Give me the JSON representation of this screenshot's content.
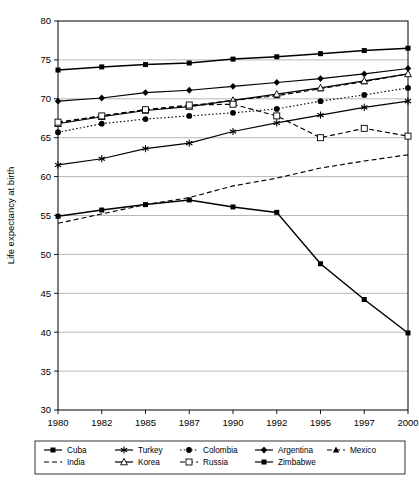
{
  "chart_data": {
    "type": "line",
    "title": "",
    "xlabel": "",
    "ylabel": "Life expectancy at birth",
    "ylim": [
      30,
      80
    ],
    "yticks": [
      30,
      35,
      40,
      45,
      50,
      55,
      60,
      65,
      70,
      75,
      80
    ],
    "grid": true,
    "legend_position": "bottom",
    "categories": [
      "1980",
      "1982",
      "1985",
      "1987",
      "1990",
      "1992",
      "1995",
      "1997",
      "2000"
    ],
    "series": [
      {
        "name": "Cuba",
        "marker": "filled-square",
        "line": "solid",
        "values": [
          73.7,
          74.1,
          74.4,
          74.6,
          75.1,
          75.4,
          75.8,
          76.2,
          76.5
        ]
      },
      {
        "name": "Turkey",
        "marker": "asterisk",
        "line": "solid",
        "values": [
          61.5,
          62.3,
          63.6,
          64.3,
          65.8,
          66.9,
          67.9,
          68.9,
          69.7
        ]
      },
      {
        "name": "Colombia",
        "marker": "filled-circle",
        "line": "dotted",
        "values": [
          65.7,
          66.8,
          67.4,
          67.8,
          68.2,
          68.7,
          69.7,
          70.5,
          71.4
        ]
      },
      {
        "name": "Argentina",
        "marker": "filled-diamond",
        "line": "solid",
        "values": [
          69.7,
          70.1,
          70.8,
          71.1,
          71.6,
          72.1,
          72.6,
          73.2,
          73.9
        ]
      },
      {
        "name": "Mexico",
        "marker": "filled-triangle",
        "line": "dashed",
        "values": [
          66.9,
          67.8,
          68.6,
          69.1,
          69.8,
          70.4,
          71.3,
          72.2,
          73.2
        ]
      },
      {
        "name": "India",
        "marker": "none",
        "line": "dashed",
        "values": [
          54.0,
          55.2,
          56.4,
          57.3,
          58.8,
          59.8,
          61.1,
          62.0,
          62.8
        ]
      },
      {
        "name": "Korea",
        "marker": "open-triangle",
        "line": "solid",
        "values": [
          66.8,
          67.7,
          68.5,
          69.0,
          69.8,
          70.6,
          71.4,
          72.3,
          73.2
        ]
      },
      {
        "name": "Russia",
        "marker": "open-square",
        "line": "dashed",
        "values": [
          67.0,
          67.8,
          68.6,
          69.2,
          69.3,
          67.8,
          65.0,
          66.2,
          65.2
        ]
      },
      {
        "name": "Zimbabwe",
        "marker": "filled-square",
        "line": "solid",
        "values": [
          54.9,
          55.7,
          56.4,
          57.0,
          56.1,
          55.4,
          48.8,
          44.2,
          39.9
        ]
      }
    ]
  },
  "axis": {
    "y_title": "Life expectancy at birth"
  },
  "legend": {
    "entries": [
      "Cuba",
      "Turkey",
      "Colombia",
      "Argentina",
      "Mexico",
      "India",
      "Korea",
      "Russia",
      "Zimbabwe"
    ]
  },
  "colors": {
    "line": "#000000",
    "grid": "#9a9a9a",
    "background": "#ffffff"
  }
}
